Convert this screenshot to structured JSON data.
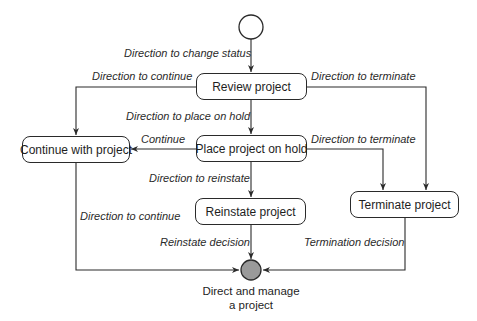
{
  "diagram": {
    "type": "state-diagram",
    "colors": {
      "line": "#2a2a2a",
      "end_fill": "#9a9a9a",
      "background": "#ffffff"
    },
    "states": {
      "review": "Review project",
      "hold": "Place project on hold",
      "continue": "Continue with project",
      "reinstate": "Reinstate project",
      "terminate": "Terminate project"
    },
    "end_caption": {
      "line1": "Direct and manage",
      "line2": "a project"
    },
    "transitions": {
      "start_to_review": "Direction to change status",
      "review_to_continue": "Direction to continue",
      "review_to_terminate": "Direction to terminate",
      "review_to_hold": "Direction to place on hold",
      "hold_to_continue": "Continue",
      "hold_to_terminate": "Direction to terminate",
      "hold_to_reinstate": "Direction to reinstate",
      "continue_to_end": "Direction to continue",
      "reinstate_to_end": "Reinstate decision",
      "terminate_to_end": "Termination decision"
    }
  }
}
